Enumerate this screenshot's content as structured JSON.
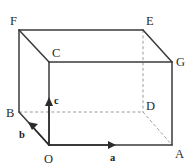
{
  "figure": {
    "type": "geometry-diagram",
    "shape": "cuboid",
    "colors": {
      "visible_edge": "#3a3a3a",
      "hidden_edge": "#9a9a9a",
      "vector": "#2b2b2b",
      "background": "#ffffff"
    },
    "vertices": [
      {
        "id": "F",
        "label": "F",
        "x": 19,
        "y": 30,
        "label_x": 10,
        "label_y": 25,
        "hidden": false
      },
      {
        "id": "E",
        "label": "E",
        "x": 143,
        "y": 30,
        "label_x": 146,
        "label_y": 25,
        "hidden": false
      },
      {
        "id": "C",
        "label": "C",
        "x": 49,
        "y": 62,
        "label_x": 52,
        "label_y": 57,
        "hidden": false
      },
      {
        "id": "G",
        "label": "G",
        "x": 172,
        "y": 62,
        "label_x": 176,
        "label_y": 66,
        "hidden": false
      },
      {
        "id": "B",
        "label": "B",
        "x": 19,
        "y": 112,
        "label_x": 8,
        "label_y": 117,
        "hidden": false
      },
      {
        "id": "D",
        "label": "D",
        "x": 143,
        "y": 112,
        "label_x": 146,
        "label_y": 110,
        "hidden": true
      },
      {
        "id": "O",
        "label": "O",
        "x": 49,
        "y": 145,
        "label_x": 45,
        "label_y": 163,
        "hidden": false
      },
      {
        "id": "A",
        "label": "A",
        "x": 172,
        "y": 145,
        "label_x": 175,
        "label_y": 158,
        "hidden": false
      }
    ],
    "visible_edges": [
      {
        "name": "F-E",
        "from": "F",
        "to": "E"
      },
      {
        "name": "F-C",
        "from": "F",
        "to": "C"
      },
      {
        "name": "F-B",
        "from": "F",
        "to": "B"
      },
      {
        "name": "E-G",
        "from": "E",
        "to": "G"
      },
      {
        "name": "C-G",
        "from": "C",
        "to": "G"
      },
      {
        "name": "C-O",
        "from": "C",
        "to": "O"
      },
      {
        "name": "G-A",
        "from": "G",
        "to": "A"
      },
      {
        "name": "B-O",
        "from": "B",
        "to": "O"
      },
      {
        "name": "O-A",
        "from": "O",
        "to": "A"
      }
    ],
    "hidden_edges": [
      {
        "name": "B-D",
        "from": "B",
        "to": "D"
      },
      {
        "name": "D-A",
        "from": "D",
        "to": "A"
      },
      {
        "name": "E-D",
        "from": "E",
        "to": "D"
      }
    ],
    "vectors": [
      {
        "id": "a",
        "label": "a",
        "from": "O",
        "toward": "A",
        "x1": 49,
        "y1": 145,
        "x2": 114,
        "y2": 145,
        "label_x": 110,
        "label_y": 160,
        "direction": "right"
      },
      {
        "id": "b",
        "label": "b",
        "from": "O",
        "toward": "B",
        "x1": 49,
        "y1": 145,
        "x2": 30,
        "y2": 124,
        "label_x": 21,
        "label_y": 137,
        "direction": "up-left"
      },
      {
        "id": "c",
        "label": "c",
        "from": "O",
        "toward": "C",
        "x1": 49,
        "y1": 145,
        "x2": 49,
        "y2": 100,
        "label_x": 54,
        "label_y": 103,
        "direction": "up"
      }
    ]
  }
}
